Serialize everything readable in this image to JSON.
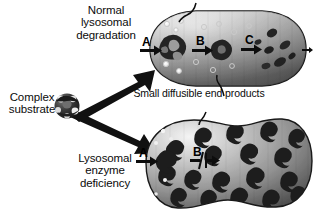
{
  "figure": {
    "background_color": "#ffffff",
    "ink_color": "#0b0b0b"
  },
  "labels": {
    "normal_pathway": "Normal\nlysosomal\ndegradation",
    "complex_substrate": "Complex\nsubstrate",
    "enzyme_deficiency": "Lysosomal\nenzyme\ndeficiency",
    "small_products": "Small diffusible end products"
  },
  "top_panel": {
    "name": "normal-lysosome",
    "steps": [
      {
        "label": "A",
        "blocked": false
      },
      {
        "label": "B",
        "blocked": false
      },
      {
        "label": "C",
        "blocked": false
      }
    ],
    "substrate_states": [
      "large-intact-aggregate",
      "partially-degraded-fragment",
      "small-fragments-dispersing"
    ],
    "end_products_count": 12,
    "has_exit_arrow": true,
    "fill_gradient": [
      "#f2f2f2",
      "#8d8d8d",
      "#4a4a4a"
    ]
  },
  "bottom_panel": {
    "name": "deficient-lysosome",
    "steps": [
      {
        "label": "A",
        "blocked": false
      },
      {
        "label": "B",
        "blocked": true
      }
    ],
    "substrate_states": [
      "accumulated-undegraded-substrate"
    ],
    "stored_particles_count": 26,
    "has_exit_arrow": false,
    "distended": true,
    "fill_gradient": [
      "#e9e9e9",
      "#8a8a8a",
      "#3f3f3f"
    ]
  },
  "big_arrows": [
    {
      "name": "arrow-to-normal",
      "direction": "up-right"
    },
    {
      "name": "arrow-to-deficient",
      "direction": "down-right"
    }
  ],
  "colors": {
    "substrate_dark": "#2a2a2a",
    "vesicle_mid": "#9a9a9a",
    "vesicle_light": "#efefef",
    "outline": "#1a1a1a",
    "product_ring": "#e8e8e8"
  }
}
